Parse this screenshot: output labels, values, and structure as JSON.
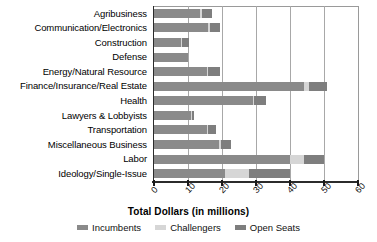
{
  "chart_data": {
    "type": "bar",
    "orientation": "horizontal",
    "stacked": true,
    "title": "",
    "xlabel": "Total Dollars (in millions)",
    "ylabel": "",
    "xlim": [
      0,
      60
    ],
    "xticks": [
      0,
      10,
      20,
      30,
      40,
      50,
      60
    ],
    "xticklabels": [
      "0",
      "10",
      "20",
      "30",
      "40",
      "50",
      "60"
    ],
    "grid": "vertical",
    "legend_position": "bottom",
    "categories": [
      "Agribusiness",
      "Communication/Electronics",
      "Construction",
      "Defense",
      "Energy/Natural Resource",
      "Finance/Insurance/Real Estate",
      "Health",
      "Lawyers & Lobbyists",
      "Transportation",
      "Miscellaneous Business",
      "Labor",
      "Ideology/Single-Issue"
    ],
    "series": [
      {
        "name": "Incumbents",
        "color": "#8a8a8a",
        "values": [
          13.5,
          16.0,
          8.0,
          10.0,
          15.5,
          44.0,
          29.0,
          11.0,
          15.5,
          19.0,
          40.0,
          21.0
        ]
      },
      {
        "name": "Challengers",
        "color": "#d6d6d6",
        "values": [
          0.5,
          0.5,
          0.3,
          0.0,
          0.5,
          1.5,
          0.5,
          0.3,
          0.3,
          0.7,
          4.0,
          7.0
        ]
      },
      {
        "name": "Open Seats",
        "color": "#7e7e7e",
        "values": [
          3.0,
          3.0,
          2.0,
          0.0,
          3.5,
          5.5,
          3.5,
          0.5,
          2.5,
          3.0,
          6.0,
          12.0
        ]
      }
    ]
  },
  "legend": {
    "items": [
      {
        "label": "Incumbents",
        "color": "#8a8a8a"
      },
      {
        "label": "Challengers",
        "color": "#d6d6d6"
      },
      {
        "label": "Open Seats",
        "color": "#7e7e7e"
      }
    ]
  },
  "axis": {
    "x_title": "Total Dollars (in millions)"
  },
  "colors": {
    "incumbents": "#8a8a8a",
    "challengers": "#d6d6d6",
    "open_seats": "#7e7e7e",
    "gridline": "#a8a8a8",
    "axis": "#2b2b2b",
    "background": "#ffffff"
  }
}
